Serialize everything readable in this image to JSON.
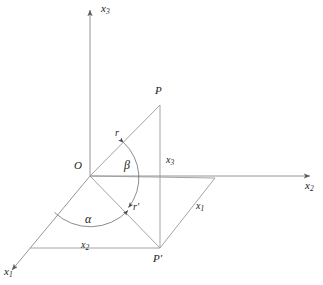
{
  "figure": {
    "kind": "3d-spherical-coordinates-diagram",
    "background_color": "#ffffff",
    "line_color": "#8a8a8a",
    "text_color": "#1a1a1a",
    "axes": {
      "x3": {
        "label": "x",
        "subscript": "3",
        "direction": "up"
      },
      "x2": {
        "label": "x",
        "subscript": "2",
        "direction": "right"
      },
      "x1": {
        "label": "x",
        "subscript": "1",
        "direction": "down-left"
      }
    },
    "points": {
      "origin": "O",
      "p": "P",
      "p_prime": "P′"
    },
    "segments": {
      "r": "r",
      "r_prime": "r′",
      "height_x3": {
        "label": "x",
        "subscript": "3"
      },
      "edge_x1": {
        "label": "x",
        "subscript": "1"
      },
      "edge_x2": {
        "label": "x",
        "subscript": "2"
      }
    },
    "angles": {
      "alpha": "α",
      "beta": "β"
    },
    "geometry": {
      "origin_xy": [
        90,
        176
      ],
      "p_xy": [
        160,
        105
      ],
      "p_prime_xy": [
        160,
        248
      ],
      "foot_left_xy": [
        30,
        248
      ],
      "corner_right_xy": [
        215,
        178
      ],
      "x3_tip_xy": [
        90,
        8
      ],
      "x2_tip_xy": [
        312,
        176
      ],
      "x1_tip_xy": [
        10,
        272
      ]
    }
  }
}
